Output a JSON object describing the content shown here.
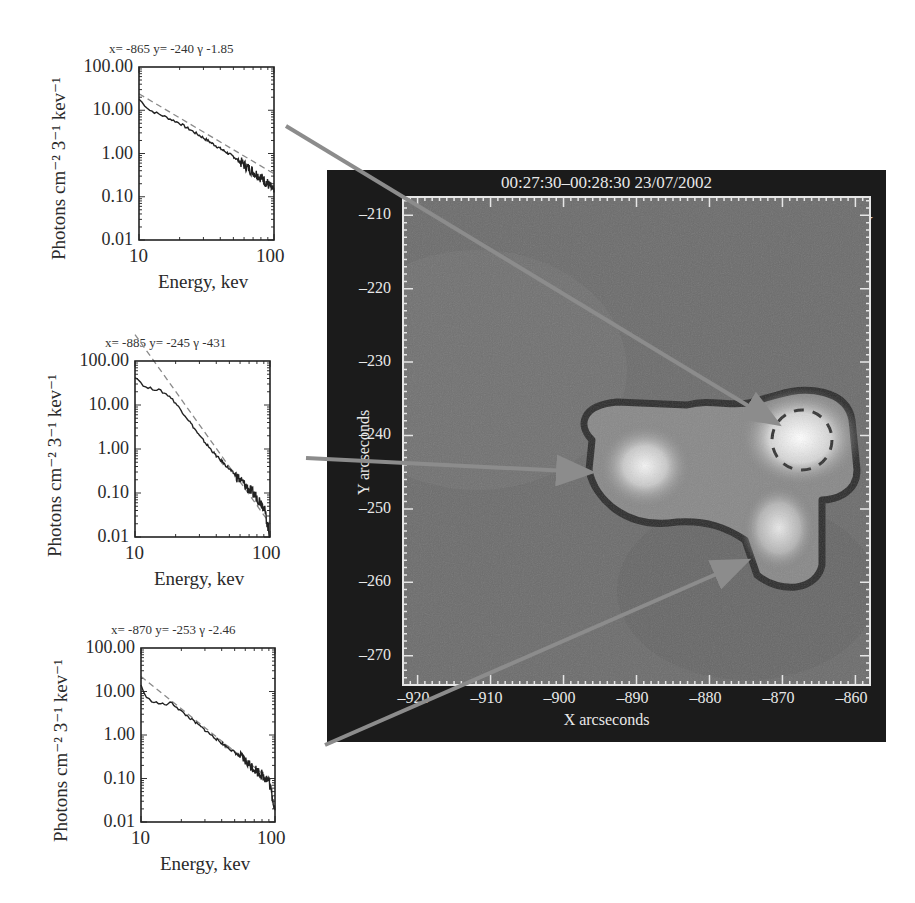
{
  "spectra": [
    {
      "title": "x= -865  y= -240  γ -1.85",
      "x": -865,
      "y": -240,
      "gamma": -1.85,
      "ylabel": "Photons cm⁻² 3⁻¹ kev⁻¹",
      "xlabel": "Energy, kev",
      "yticks": [
        "100.00",
        "10.00",
        "1.00",
        "0.10",
        "0.01"
      ],
      "xticks": [
        "10",
        "100"
      ],
      "box": {
        "left": 139,
        "top": 67,
        "width": 135,
        "height": 173
      }
    },
    {
      "title": "x= -885  y= -245  γ -431",
      "x": -885,
      "y": -245,
      "gamma": -4.31,
      "ylabel": "Photons cm⁻² 3⁻¹ kev⁻¹",
      "xlabel": "Energy, kev",
      "yticks": [
        "100.00",
        "10.00",
        "1.00",
        "0.10",
        "0.01"
      ],
      "xticks": [
        "10",
        "100"
      ],
      "box": {
        "left": 135,
        "top": 361,
        "width": 135,
        "height": 176
      }
    },
    {
      "title": "x= -870  y= -253  γ -2.46",
      "x": -870,
      "y": -253,
      "gamma": -2.46,
      "ylabel": "Photons cm⁻² 3⁻¹ kev⁻¹",
      "xlabel": "Energy, kev",
      "yticks": [
        "100.00",
        "10.00",
        "1.00",
        "0.10",
        "0.01"
      ],
      "xticks": [
        "10",
        "100"
      ],
      "box": {
        "left": 141,
        "top": 648,
        "width": 134,
        "height": 174
      }
    }
  ],
  "image": {
    "title": "00:27:30–00:28:30 23/07/2002",
    "energy_band": "029–030keV",
    "xlabel": "X arcseconds",
    "ylabel": "Y arcseconds",
    "xticks": [
      "-920",
      "-910",
      "-900",
      "-890",
      "-880",
      "-870",
      "-860"
    ],
    "yticks": [
      "-210",
      "-220",
      "-230",
      "-240",
      "-250",
      "-260",
      "-270"
    ]
  },
  "colors": {
    "frame": "#1b1b1b",
    "image_bg": "#6e6e6e",
    "arrow": "#8c8c8c",
    "spectrum_line": "#222222",
    "fit_line": "#8a8a8a"
  },
  "chart_data": [
    {
      "type": "line",
      "title": "x= -865 y= -240 γ -1.85",
      "xlabel": "Energy, kev",
      "ylabel": "Photons cm^-2 s^-1 kev^-1",
      "xscale": "log",
      "yscale": "log",
      "xlim": [
        10,
        100
      ],
      "ylim": [
        0.01,
        100
      ],
      "x_tick_labels": [
        "10",
        "100"
      ],
      "y_tick_labels": [
        "100.00",
        "10.00",
        "1.00",
        "0.10",
        "0.01"
      ],
      "series": [
        {
          "name": "observed spectrum",
          "style": "solid",
          "x": [
            10,
            12,
            15,
            20,
            30,
            40,
            50,
            60,
            70,
            80,
            90,
            100
          ],
          "values": [
            18,
            10,
            7.5,
            5.0,
            2.3,
            1.3,
            0.85,
            0.55,
            0.38,
            0.28,
            0.2,
            0.13
          ]
        },
        {
          "name": "power-law fit",
          "style": "dashed",
          "x": [
            10,
            100
          ],
          "values": [
            24,
            0.34
          ]
        }
      ]
    },
    {
      "type": "line",
      "title": "x= -885 y= -245 γ -431",
      "xlabel": "Energy, kev",
      "ylabel": "Photons cm^-2 s^-1 kev^-1",
      "xscale": "log",
      "yscale": "log",
      "xlim": [
        10,
        100
      ],
      "ylim": [
        0.01,
        100
      ],
      "x_tick_labels": [
        "10",
        "100"
      ],
      "y_tick_labels": [
        "100.00",
        "10.00",
        "1.00",
        "0.10",
        "0.01"
      ],
      "series": [
        {
          "name": "observed spectrum",
          "style": "solid",
          "x": [
            10,
            12,
            15,
            18,
            20,
            25,
            30,
            40,
            50,
            60,
            70,
            80,
            90,
            100
          ],
          "values": [
            45,
            25,
            22,
            16,
            11,
            4.5,
            2.0,
            0.7,
            0.35,
            0.2,
            0.12,
            0.08,
            0.05,
            0.01
          ]
        },
        {
          "name": "power-law fit",
          "style": "dashed",
          "x": [
            10,
            100
          ],
          "values": [
            400,
            0.02
          ]
        }
      ]
    },
    {
      "type": "line",
      "title": "x= -870 y= -253 γ -2.46",
      "xlabel": "Energy, kev",
      "ylabel": "Photons cm^-2 s^-1 kev^-1",
      "xscale": "log",
      "yscale": "log",
      "xlim": [
        10,
        100
      ],
      "ylim": [
        0.01,
        100
      ],
      "x_tick_labels": [
        "10",
        "100"
      ],
      "y_tick_labels": [
        "100.00",
        "10.00",
        "1.00",
        "0.10",
        "0.01"
      ],
      "series": [
        {
          "name": "observed spectrum",
          "style": "solid",
          "x": [
            10,
            11,
            13,
            15,
            17,
            20,
            30,
            40,
            50,
            60,
            70,
            80,
            90,
            100
          ],
          "values": [
            14,
            7,
            5.5,
            5.0,
            5.5,
            3.5,
            1.3,
            0.65,
            0.4,
            0.25,
            0.17,
            0.12,
            0.09,
            0.02
          ]
        },
        {
          "name": "power-law fit",
          "style": "dashed",
          "x": [
            10,
            100
          ],
          "values": [
            22,
            0.076
          ]
        }
      ]
    }
  ]
}
